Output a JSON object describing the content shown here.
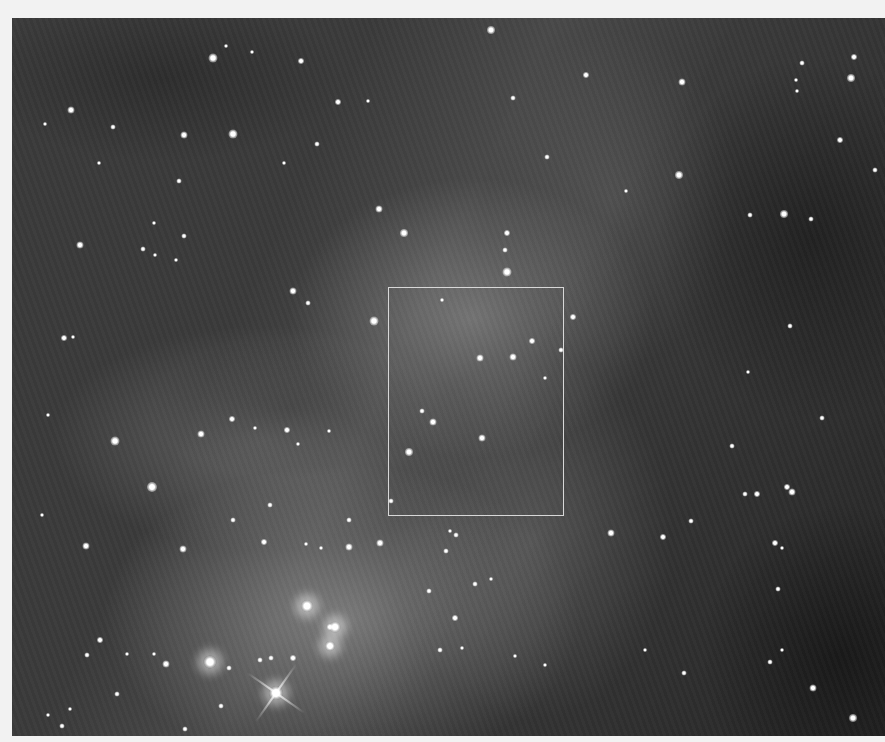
{
  "image": {
    "description": "Grayscale astronomical image of a nebula with a dense star field",
    "frame_background": "#f2f2f2",
    "photo_rect": {
      "x": 12,
      "y": 18,
      "w": 873,
      "h": 718
    },
    "roi_box": {
      "x": 388,
      "y": 287,
      "w": 176,
      "h": 229,
      "color": "#d8d8d8"
    }
  },
  "stars": [
    [
      213,
      58,
      9
    ],
    [
      226,
      46,
      4
    ],
    [
      252,
      52,
      4
    ],
    [
      301,
      61,
      6
    ],
    [
      71,
      110,
      7
    ],
    [
      45,
      124,
      4
    ],
    [
      113,
      127,
      5
    ],
    [
      184,
      135,
      7
    ],
    [
      233,
      134,
      9
    ],
    [
      338,
      102,
      6
    ],
    [
      368,
      101,
      4
    ],
    [
      317,
      144,
      5
    ],
    [
      284,
      163,
      4
    ],
    [
      99,
      163,
      4
    ],
    [
      179,
      181,
      5
    ],
    [
      154,
      223,
      4
    ],
    [
      379,
      209,
      7
    ],
    [
      404,
      233,
      8
    ],
    [
      80,
      245,
      7
    ],
    [
      155,
      255,
      4
    ],
    [
      184,
      236,
      5
    ],
    [
      143,
      249,
      5
    ],
    [
      176,
      260,
      4
    ],
    [
      293,
      291,
      7
    ],
    [
      308,
      303,
      5
    ],
    [
      374,
      321,
      9
    ],
    [
      64,
      338,
      6
    ],
    [
      73,
      337,
      4
    ],
    [
      491,
      30,
      8
    ],
    [
      513,
      98,
      5
    ],
    [
      586,
      75,
      6
    ],
    [
      682,
      82,
      7
    ],
    [
      802,
      63,
      5
    ],
    [
      854,
      57,
      6
    ],
    [
      851,
      78,
      8
    ],
    [
      796,
      80,
      4
    ],
    [
      797,
      91,
      4
    ],
    [
      547,
      157,
      5
    ],
    [
      626,
      191,
      4
    ],
    [
      679,
      175,
      8
    ],
    [
      750,
      215,
      5
    ],
    [
      784,
      214,
      8
    ],
    [
      811,
      219,
      5
    ],
    [
      840,
      140,
      6
    ],
    [
      875,
      170,
      5
    ],
    [
      507,
      233,
      6
    ],
    [
      507,
      272,
      9
    ],
    [
      505,
      250,
      5
    ],
    [
      573,
      317,
      6
    ],
    [
      480,
      358,
      7
    ],
    [
      513,
      357,
      7
    ],
    [
      532,
      341,
      6
    ],
    [
      561,
      350,
      5
    ],
    [
      545,
      378,
      4
    ],
    [
      442,
      300,
      4
    ],
    [
      48,
      415,
      4
    ],
    [
      115,
      441,
      9
    ],
    [
      152,
      487,
      10
    ],
    [
      201,
      434,
      7
    ],
    [
      232,
      419,
      6
    ],
    [
      255,
      428,
      4
    ],
    [
      287,
      430,
      6
    ],
    [
      298,
      444,
      4
    ],
    [
      329,
      431,
      4
    ],
    [
      409,
      452,
      8
    ],
    [
      433,
      422,
      7
    ],
    [
      422,
      411,
      5
    ],
    [
      482,
      438,
      7
    ],
    [
      86,
      546,
      7
    ],
    [
      42,
      515,
      4
    ],
    [
      183,
      549,
      7
    ],
    [
      233,
      520,
      5
    ],
    [
      264,
      542,
      6
    ],
    [
      270,
      505,
      5
    ],
    [
      306,
      544,
      4
    ],
    [
      321,
      548,
      4
    ],
    [
      349,
      547,
      7
    ],
    [
      380,
      543,
      7
    ],
    [
      349,
      520,
      5
    ],
    [
      391,
      501,
      5
    ],
    [
      456,
      535,
      5
    ],
    [
      450,
      531,
      4
    ],
    [
      446,
      551,
      5
    ],
    [
      475,
      584,
      5
    ],
    [
      429,
      591,
      5
    ],
    [
      455,
      618,
      6
    ],
    [
      491,
      579,
      4
    ],
    [
      611,
      533,
      7
    ],
    [
      663,
      537,
      6
    ],
    [
      691,
      521,
      5
    ],
    [
      745,
      494,
      5
    ],
    [
      757,
      494,
      6
    ],
    [
      787,
      487,
      6
    ],
    [
      792,
      492,
      7
    ],
    [
      775,
      543,
      6
    ],
    [
      782,
      548,
      4
    ],
    [
      778,
      589,
      5
    ],
    [
      732,
      446,
      5
    ],
    [
      822,
      418,
      5
    ],
    [
      748,
      372,
      4
    ],
    [
      790,
      326,
      5
    ],
    [
      100,
      640,
      6
    ],
    [
      87,
      655,
      5
    ],
    [
      127,
      654,
      4
    ],
    [
      154,
      654,
      4
    ],
    [
      166,
      664,
      7
    ],
    [
      229,
      668,
      5
    ],
    [
      260,
      660,
      5
    ],
    [
      271,
      658,
      5
    ],
    [
      293,
      658,
      6
    ],
    [
      330,
      627,
      6
    ],
    [
      221,
      706,
      5
    ],
    [
      185,
      729,
      5
    ],
    [
      62,
      726,
      5
    ],
    [
      70,
      709,
      4
    ],
    [
      48,
      715,
      4
    ],
    [
      117,
      694,
      5
    ],
    [
      440,
      650,
      5
    ],
    [
      462,
      648,
      4
    ],
    [
      515,
      656,
      4
    ],
    [
      545,
      665,
      4
    ],
    [
      813,
      688,
      7
    ],
    [
      853,
      718,
      8
    ],
    [
      782,
      650,
      4
    ],
    [
      770,
      662,
      5
    ],
    [
      684,
      673,
      5
    ],
    [
      645,
      650,
      4
    ]
  ],
  "bright_stars": [
    [
      210,
      662,
      13
    ],
    [
      307,
      606,
      12
    ],
    [
      335,
      627,
      11
    ],
    [
      330,
      646,
      10
    ],
    [
      276,
      693,
      14
    ]
  ],
  "spikes": [
    [
      276,
      693
    ]
  ]
}
